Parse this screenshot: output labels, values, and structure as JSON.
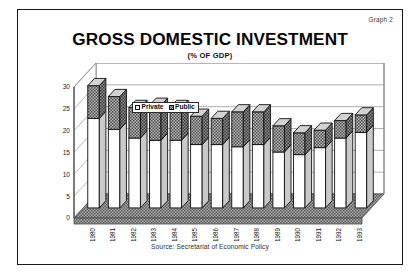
{
  "figure": {
    "graph_label": "Graph 2",
    "title": "GROSS DOMESTIC INVESTMENT",
    "subtitle": "(% OF GDP)",
    "source": "Source: Secretariat of Economic Policy"
  },
  "legend": {
    "private_label": "Private",
    "public_label": "Public"
  },
  "colors": {
    "private_fill": "#ffffff",
    "public_fill": "#b6b6b6",
    "outline": "#111111",
    "gridline": "#9a9a9a",
    "floor": "#a8a8a8",
    "frame": "#1a1a1a"
  },
  "chart_data": {
    "type": "bar",
    "stacked": true,
    "three_d": true,
    "title": "GROSS DOMESTIC INVESTMENT",
    "subtitle": "(% OF GDP)",
    "xlabel": "",
    "ylabel": "",
    "ylim": [
      0,
      30
    ],
    "yticks": [
      0,
      5,
      10,
      15,
      20,
      25,
      30
    ],
    "ytick_labels": [
      "0",
      "5",
      "10",
      "15",
      "20",
      "25",
      "30"
    ],
    "grid": true,
    "legend_position": "top-center-inside",
    "categories": [
      "1980",
      "1981",
      "1982",
      "1983",
      "1984",
      "1985",
      "1986",
      "1987",
      "1988",
      "1989",
      "1990",
      "1991",
      "1992",
      "1993"
    ],
    "series": [
      {
        "name": "Private",
        "values": [
          20.5,
          18.0,
          16.0,
          15.5,
          15.5,
          14.5,
          14.5,
          14.0,
          14.5,
          12.8,
          12.2,
          13.8,
          16.0,
          17.3
        ]
      },
      {
        "name": "Public",
        "values": [
          7.5,
          7.5,
          7.0,
          8.0,
          7.5,
          6.5,
          6.0,
          8.0,
          7.5,
          6.0,
          5.0,
          4.0,
          4.0,
          4.0
        ]
      }
    ],
    "totals": [
      28.0,
      25.5,
      23.0,
      23.5,
      23.0,
      21.0,
      20.5,
      22.0,
      22.0,
      18.8,
      17.2,
      17.8,
      20.0,
      21.3
    ]
  }
}
